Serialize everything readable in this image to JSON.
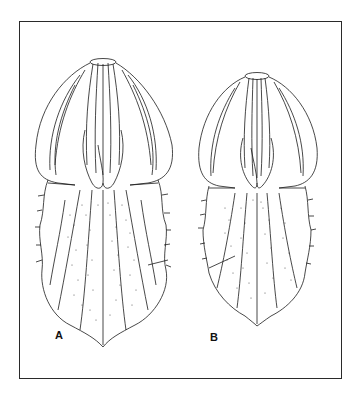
{
  "figure": {
    "panels": [
      {
        "label": "A",
        "description": "botanical-organ-drawing"
      },
      {
        "label": "B",
        "description": "botanical-organ-drawing"
      }
    ],
    "colors": {
      "line": "#1a1a1a",
      "background": "#ffffff",
      "frame": "#2a2a2a"
    }
  }
}
